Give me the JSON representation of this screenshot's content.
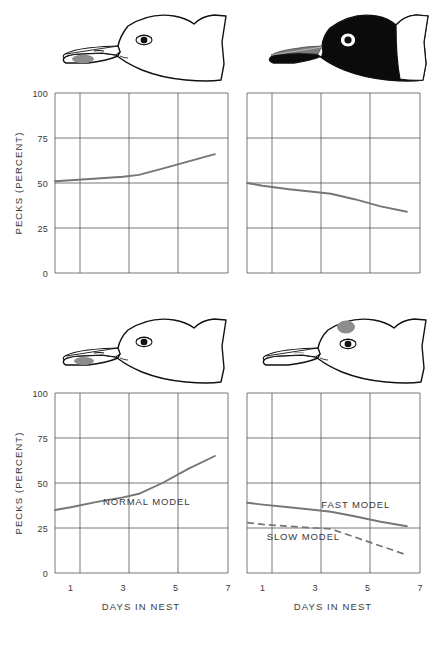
{
  "figure": {
    "panels": [
      {
        "id": "top-left",
        "head": {
          "name": "normal-white-head-with-bill-spot",
          "head_fill": "#ffffff",
          "outline": "#111111",
          "spot_fill": "#8d8d8d",
          "spot_location": "lower-bill"
        },
        "axis": {
          "ylabel": "PECKS (PERCENT)",
          "xlabel": "",
          "show_xlabel": false,
          "show_xticklabels": false,
          "yticks": [
            0,
            25,
            50,
            75,
            100
          ],
          "xticks": [
            1,
            3,
            5,
            7
          ]
        }
      },
      {
        "id": "top-right",
        "head": {
          "name": "black-head-model-with-white-nape",
          "head_fill": "#0b0b0b",
          "outline": "#111111",
          "spot_fill": "#8d8d8d",
          "spot_location": "bill-stripe"
        },
        "axis": {
          "ylabel": "",
          "xlabel": "",
          "show_xlabel": false,
          "show_xticklabels": false,
          "yticks": [
            0,
            25,
            50,
            75,
            100
          ],
          "xticks": [
            1,
            3,
            5,
            7
          ]
        }
      },
      {
        "id": "bottom-left",
        "head": {
          "name": "normal-white-head-with-bill-spot",
          "head_fill": "#ffffff",
          "outline": "#111111",
          "spot_fill": "#8d8d8d",
          "spot_location": "lower-bill"
        },
        "axis": {
          "ylabel": "PECKS (PERCENT)",
          "xlabel": "DAYS IN NEST",
          "show_xlabel": true,
          "show_xticklabels": true,
          "yticks": [
            0,
            25,
            50,
            75,
            100
          ],
          "xticks": [
            1,
            3,
            5,
            7
          ]
        }
      },
      {
        "id": "bottom-right",
        "head": {
          "name": "white-head-with-forehead-spot",
          "head_fill": "#ffffff",
          "outline": "#111111",
          "spot_fill": "#8d8d8d",
          "spot_location": "forehead"
        },
        "axis": {
          "ylabel": "",
          "xlabel": "DAYS IN NEST",
          "show_xlabel": true,
          "show_xticklabels": true,
          "yticks": [
            0,
            25,
            50,
            75,
            100
          ],
          "xticks": [
            1,
            3,
            5,
            7
          ]
        }
      }
    ],
    "line_color": "#767676",
    "grid_color": "#555555",
    "frame_color": "#333333"
  },
  "chart_data": [
    {
      "id": "top-left",
      "type": "line",
      "title": "",
      "xlabel": "",
      "ylabel": "PECKS (PERCENT)",
      "xlim": [
        0.4,
        7
      ],
      "ylim": [
        0,
        100
      ],
      "xticks": [
        1,
        3,
        5,
        7
      ],
      "yticks": [
        0,
        25,
        50,
        75,
        100
      ],
      "grid": true,
      "legend": "none",
      "series": [
        {
          "name": "",
          "style": "solid",
          "x": [
            0.4,
            1,
            2,
            3,
            3.6,
            4.5,
            5.5,
            6.5
          ],
          "values": [
            51,
            51.5,
            52.5,
            53.5,
            54.5,
            58,
            62,
            66
          ]
        }
      ]
    },
    {
      "id": "top-right",
      "type": "line",
      "title": "",
      "xlabel": "",
      "ylabel": "",
      "xlim": [
        0.4,
        7
      ],
      "ylim": [
        0,
        100
      ],
      "xticks": [
        1,
        3,
        5,
        7
      ],
      "yticks": [
        0,
        25,
        50,
        75,
        100
      ],
      "grid": true,
      "legend": "none",
      "series": [
        {
          "name": "",
          "style": "solid",
          "x": [
            0.4,
            1,
            2,
            3,
            3.6,
            4.5,
            5.5,
            6.5
          ],
          "values": [
            50,
            48.5,
            46.5,
            45,
            44,
            41,
            37,
            34
          ]
        }
      ]
    },
    {
      "id": "bottom-left",
      "type": "line",
      "title": "",
      "xlabel": "DAYS IN NEST",
      "ylabel": "PECKS (PERCENT)",
      "xlim": [
        0.4,
        7
      ],
      "ylim": [
        0,
        100
      ],
      "xticks": [
        1,
        3,
        5,
        7
      ],
      "yticks": [
        0,
        25,
        50,
        75,
        100
      ],
      "grid": true,
      "legend": "inline-annotation",
      "annotations": [
        {
          "text": "NORMAL MODEL",
          "x": 3.9,
          "y": 38
        }
      ],
      "series": [
        {
          "name": "NORMAL MODEL",
          "style": "solid",
          "x": [
            0.4,
            1,
            2,
            3,
            3.6,
            4.5,
            5.5,
            6.5
          ],
          "values": [
            35,
            36.5,
            39.5,
            42,
            44,
            50,
            58,
            65
          ]
        }
      ]
    },
    {
      "id": "bottom-right",
      "type": "line",
      "title": "",
      "xlabel": "DAYS IN NEST",
      "ylabel": "",
      "xlim": [
        0.4,
        7
      ],
      "ylim": [
        0,
        100
      ],
      "xticks": [
        1,
        3,
        5,
        7
      ],
      "yticks": [
        0,
        25,
        50,
        75,
        100
      ],
      "grid": true,
      "legend": "inline-annotation",
      "annotations": [
        {
          "text": "FAST MODEL",
          "x": 4.55,
          "y": 36
        },
        {
          "text": "SLOW MODEL",
          "x": 2.55,
          "y": 18.5
        }
      ],
      "series": [
        {
          "name": "FAST MODEL",
          "style": "solid",
          "x": [
            0.4,
            1,
            2,
            3,
            3.6,
            4.5,
            5.5,
            6.5
          ],
          "values": [
            39,
            38,
            36.5,
            35,
            34,
            31.5,
            28.5,
            26
          ]
        },
        {
          "name": "SLOW MODEL",
          "style": "dashed",
          "x": [
            0.4,
            1,
            2,
            3,
            3.6,
            4.5,
            5.5,
            6.5
          ],
          "values": [
            28,
            27,
            26,
            25,
            24.5,
            20,
            15,
            10
          ]
        }
      ]
    }
  ]
}
